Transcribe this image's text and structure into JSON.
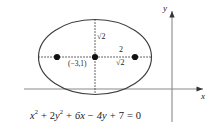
{
  "figure": {
    "axes": {
      "x_label": "x",
      "y_label": "y"
    },
    "annotations": {
      "semi_minor": "√2",
      "semi_major": "√2",
      "focus_distance": "2",
      "center_coordinates": "(−3,1)"
    },
    "equation": {
      "full": "x² + 2y² + 6x − 4y + 7 = 0",
      "term1_var": "x",
      "term1_exp": "2",
      "op1": "+",
      "term2_coef": "2",
      "term2_var": "y",
      "term2_exp": "2",
      "op2": "+",
      "term3": "6x",
      "op3": "−",
      "term4": "4y",
      "op4": "+",
      "term5": "7",
      "equals": "=",
      "rhs": "0"
    },
    "colors": {
      "curve": "#3d3d3d",
      "axis": "#8a8a8a",
      "point": "#111111",
      "guide": "#555555",
      "text": "#1a1a1a"
    },
    "geometry": {
      "center": {
        "x": 95,
        "y": 57
      },
      "radius_x": 56.5,
      "radius_y": 37.5,
      "focus_left": {
        "x": 57,
        "y": 57
      },
      "focus_right": {
        "x": 135,
        "y": 57
      },
      "x_axis_y": 89,
      "y_axis_x": 172
    }
  }
}
